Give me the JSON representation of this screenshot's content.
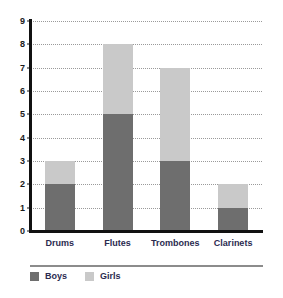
{
  "chart_data": {
    "type": "bar",
    "stacked": true,
    "title": "",
    "subtitle": "",
    "xlabel": "",
    "ylabel": "",
    "categories": [
      "Drums",
      "Flutes",
      "Trombones",
      "Clarinets"
    ],
    "series": [
      {
        "name": "Boys",
        "color": "#6e6e6e",
        "values": [
          2,
          5,
          3,
          1
        ]
      },
      {
        "name": "Girls",
        "color": "#c9c9c9",
        "values": [
          1,
          3,
          4,
          1
        ]
      }
    ],
    "totals": [
      3,
      8,
      7,
      2
    ],
    "ylim": [
      0,
      9
    ],
    "y_ticks": [
      0,
      1,
      2,
      3,
      4,
      5,
      6,
      7,
      8,
      9
    ],
    "y_tick_labels": [
      "0",
      "1",
      "2",
      "3",
      "4",
      "5",
      "6",
      "7",
      "8",
      "9"
    ],
    "grid": true,
    "grid_style": "dotted",
    "grid_color": "#9a9a9a",
    "legend_position": "bottom-left",
    "legend_entries": [
      "Boys",
      "Girls"
    ],
    "axis_color": "#111111",
    "label_color": "#2b2b50",
    "background": "#ffffff"
  },
  "legend": {
    "items": [
      {
        "label": "Boys",
        "swatch": "#6e6e6e"
      },
      {
        "label": "Girls",
        "swatch": "#c9c9c9"
      }
    ]
  }
}
